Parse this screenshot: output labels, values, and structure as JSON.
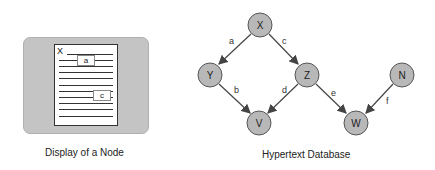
{
  "left_figure": {
    "caption": "Display of a Node",
    "node_title": "X",
    "links": [
      {
        "label": "a"
      },
      {
        "label": "c"
      }
    ]
  },
  "right_figure": {
    "caption": "Hypertext Database",
    "nodes": [
      {
        "id": "X",
        "x": 260,
        "y": 25
      },
      {
        "id": "Y",
        "x": 210,
        "y": 75
      },
      {
        "id": "Z",
        "x": 307,
        "y": 75
      },
      {
        "id": "N",
        "x": 402,
        "y": 75
      },
      {
        "id": "V",
        "x": 259,
        "y": 123
      },
      {
        "id": "W",
        "x": 356,
        "y": 123
      }
    ],
    "edges": [
      {
        "label": "a",
        "from": "X",
        "to": "Y"
      },
      {
        "label": "c",
        "from": "X",
        "to": "Z"
      },
      {
        "label": "b",
        "from": "Y",
        "to": "V"
      },
      {
        "label": "d",
        "from": "Z",
        "to": "V"
      },
      {
        "label": "e",
        "from": "Z",
        "to": "W"
      },
      {
        "label": "f",
        "from": "N",
        "to": "W"
      }
    ]
  },
  "colors": {
    "node_fill": "#b8b8b8",
    "panel_fill": "#c4c4c4",
    "edge": "#444444"
  }
}
